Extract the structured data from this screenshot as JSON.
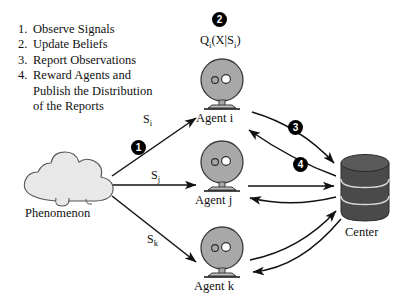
{
  "figure": {
    "colors": {
      "ink": "#111111",
      "cloud_fill": "#e8e8e8",
      "cloud_stroke": "#555555",
      "agent_fill": "#a8a8a8",
      "agent_stroke": "#3a3a3a",
      "center_fill": "#4a4a4a",
      "center_stroke": "#2a2a2a",
      "badge_fill": "#000000",
      "badge_text": "#ffffff"
    }
  },
  "protocol": {
    "steps": [
      {
        "number": "1.",
        "text": "Observe Signals",
        "continuation": ""
      },
      {
        "number": "2.",
        "text": "Update Beliefs",
        "continuation": ""
      },
      {
        "number": "3.",
        "text": "Report Observations",
        "continuation": ""
      },
      {
        "number": "4.",
        "text": "Reward Agents and",
        "continuation_1": "Publish the Distribution",
        "continuation_2": "of the Reports"
      }
    ]
  },
  "nodes": {
    "phenomenon": {
      "label": "Phenomenon",
      "icon": "cloud-icon"
    },
    "agent_i": {
      "label": "Agent i",
      "icon": "agent-icon"
    },
    "agent_j": {
      "label": "Agent j",
      "icon": "agent-icon"
    },
    "agent_k": {
      "label": "Agent k",
      "icon": "agent-icon"
    },
    "center": {
      "label": "Center",
      "icon": "database-icon"
    }
  },
  "formula": {
    "full": "Q_i(X|S_i)",
    "q": "Q",
    "q_sub": "i",
    "open": "(X|S",
    "s_sub": "i",
    "close": ")"
  },
  "signals": {
    "s_i": {
      "base": "S",
      "sub": "i"
    },
    "s_j": {
      "base": "S",
      "sub": "j"
    },
    "s_k": {
      "base": "S",
      "sub": "k"
    }
  },
  "badges": [
    {
      "id": "badge-1",
      "text": "1"
    },
    {
      "id": "badge-2",
      "text": "2"
    },
    {
      "id": "badge-3",
      "text": "3"
    },
    {
      "id": "badge-4",
      "text": "4"
    }
  ]
}
